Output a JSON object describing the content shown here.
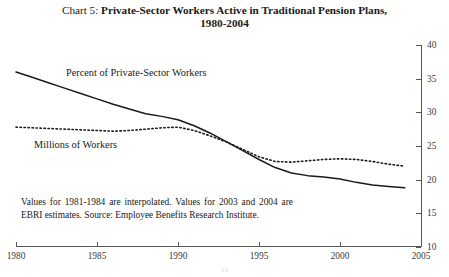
{
  "title": {
    "prefix": "Chart 5:",
    "main": "Private-Sector Workers Active in Traditional Pension Plans,",
    "line2": "1980-2004"
  },
  "footnote": "Values for 1981-1984 are interpolated. Values for 2003 and 2004 are EBRI estimates. Source: Employee Benefits Research Institute.",
  "page_number": "15",
  "axes": {
    "x_ticks": [
      "1980",
      "1985",
      "1990",
      "1995",
      "2000",
      "2005"
    ],
    "y_ticks": [
      "10",
      "15",
      "20",
      "25",
      "30",
      "35",
      "40"
    ]
  },
  "annotations": {
    "percent_label": "Percent of Private-Sector Workers",
    "millions_label": "Millions of Workers"
  },
  "colors": {
    "axis": "#55555a",
    "line": "#1a1a1a",
    "background": "#ffffff"
  },
  "chart_data": {
    "type": "line",
    "title": "Chart 5: Private-Sector Workers Active in Traditional Pension Plans, 1980-2004",
    "xlabel": "",
    "ylabel": "",
    "xlim": [
      1980,
      2005
    ],
    "ylim": [
      10,
      40
    ],
    "grid": false,
    "legend": "inline-annotations",
    "x": [
      1980,
      1981,
      1982,
      1983,
      1984,
      1985,
      1986,
      1987,
      1988,
      1989,
      1990,
      1991,
      1992,
      1993,
      1994,
      1995,
      1996,
      1997,
      1998,
      1999,
      2000,
      2001,
      2002,
      2003,
      2004
    ],
    "series": [
      {
        "name": "Percent of Private-Sector Workers",
        "style": "solid",
        "values": [
          36.0,
          35.2,
          34.4,
          33.6,
          32.8,
          32.0,
          31.2,
          30.5,
          29.8,
          29.4,
          28.9,
          28.0,
          26.9,
          25.6,
          24.3,
          23.0,
          21.8,
          21.0,
          20.6,
          20.4,
          20.1,
          19.6,
          19.2,
          19.0,
          18.8
        ]
      },
      {
        "name": "Millions of Workers",
        "style": "dotted",
        "values": [
          27.8,
          27.7,
          27.6,
          27.5,
          27.4,
          27.3,
          27.2,
          27.3,
          27.5,
          27.7,
          27.8,
          27.3,
          26.5,
          25.6,
          24.5,
          23.4,
          22.7,
          22.6,
          22.8,
          23.0,
          23.1,
          23.0,
          22.7,
          22.3,
          22.0
        ]
      }
    ]
  }
}
